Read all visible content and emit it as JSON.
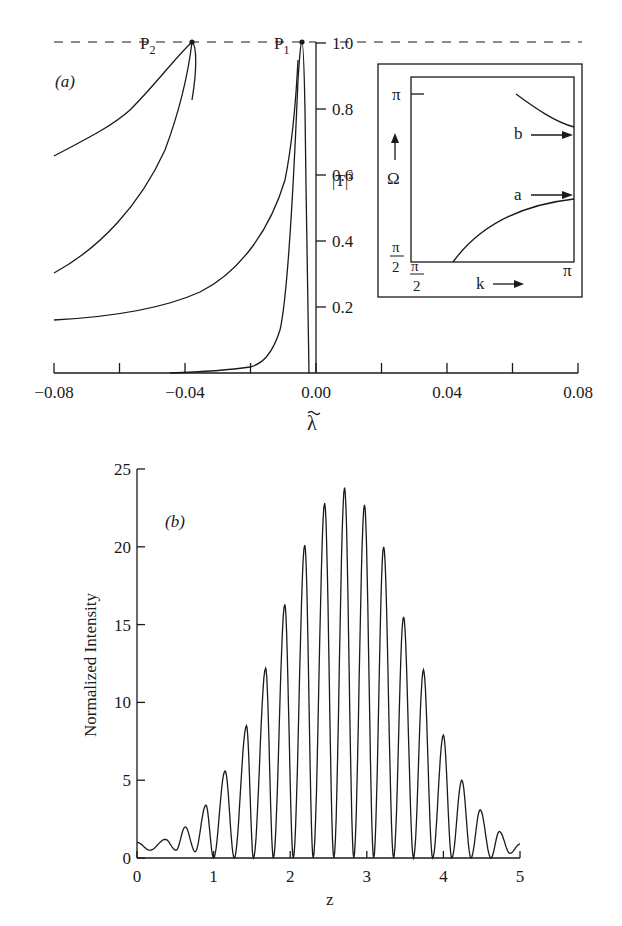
{
  "chart_data": [
    {
      "id": "a",
      "panel_label": "(a)",
      "type": "line",
      "xlabel": "λ̃",
      "ylabel": "|T|²",
      "xlim": [
        -0.08,
        0.08
      ],
      "ylim": [
        0,
        1.0
      ],
      "x_ticks": [
        "-0.08",
        "-0.04",
        "0.00",
        "0.04",
        "0.08"
      ],
      "x_minor_ticks": [
        -0.06,
        -0.02,
        0.02,
        0.06
      ],
      "y_ticks": [
        "0.2",
        "0.4",
        "0.6",
        "0.8",
        "1.0"
      ],
      "reference_line": {
        "y": 1.0,
        "style": "dashed"
      },
      "annotations": [
        {
          "text": "P₁",
          "x": -0.004,
          "y": 1.0
        },
        {
          "text": "P₂",
          "x": -0.038,
          "y": 1.0
        }
      ],
      "series": [
        {
          "name": "curve-1 (P1 peak)",
          "x": [
            -0.052,
            -0.04,
            -0.03,
            -0.02,
            -0.012,
            -0.008,
            -0.006,
            -0.0045,
            -0.004,
            -0.0035,
            -0.003,
            -0.0025,
            -0.0022
          ],
          "y": [
            0.0,
            0.01,
            0.02,
            0.05,
            0.15,
            0.35,
            0.6,
            0.9,
            1.0,
            0.9,
            0.6,
            0.3,
            0.0
          ]
        },
        {
          "name": "curve-2",
          "x": [
            -0.08,
            -0.06,
            -0.04,
            -0.03,
            -0.02,
            -0.012,
            -0.008
          ],
          "y": [
            0.17,
            0.19,
            0.25,
            0.3,
            0.41,
            0.6,
            0.95
          ]
        },
        {
          "name": "curve-3 (P2 loop lower)",
          "x": [
            -0.08,
            -0.065,
            -0.05,
            -0.042,
            -0.038
          ],
          "y": [
            0.3,
            0.42,
            0.64,
            0.86,
            1.0
          ]
        },
        {
          "name": "curve-4 (P2 loop upper)",
          "x": [
            -0.08,
            -0.065,
            -0.052,
            -0.044,
            -0.038
          ],
          "y": [
            0.66,
            0.74,
            0.85,
            0.94,
            1.0
          ]
        }
      ],
      "inset": {
        "xlabel": "k",
        "ylabel": "Ω",
        "x_tick_labels": [
          "π/2",
          "π"
        ],
        "y_tick_labels": [
          "π/2",
          "π"
        ],
        "branch_labels": [
          "a",
          "b"
        ],
        "series": [
          {
            "name": "a",
            "k": [
              1.83,
              2.2,
              2.6,
              3.0,
              3.14
            ],
            "omega": [
              1.57,
              1.95,
              2.25,
              2.42,
              2.46
            ]
          },
          {
            "name": "b",
            "k": [
              2.6,
              2.8,
              3.0,
              3.14
            ],
            "omega": [
              3.14,
              3.0,
              2.88,
              2.83
            ]
          }
        ]
      }
    },
    {
      "id": "b",
      "panel_label": "(b)",
      "type": "line",
      "xlabel": "z",
      "ylabel": "Normalized Intensity",
      "xlim": [
        0,
        5
      ],
      "ylim": [
        0,
        25
      ],
      "x_ticks": [
        "0",
        "1",
        "2",
        "3",
        "4",
        "5"
      ],
      "y_ticks": [
        "0",
        "5",
        "10",
        "15",
        "20",
        "25"
      ],
      "peaks": {
        "z": [
          0.37,
          0.63,
          0.9,
          1.15,
          1.43,
          1.68,
          1.93,
          2.19,
          2.45,
          2.71,
          2.97,
          3.22,
          3.48,
          3.74,
          4.0,
          4.24,
          4.48,
          4.73
        ],
        "intensity": [
          1.2,
          2.0,
          3.4,
          5.6,
          8.5,
          12.2,
          16.3,
          20.1,
          22.8,
          23.8,
          22.7,
          20.0,
          15.5,
          12.1,
          7.9,
          5.0,
          3.1,
          1.7
        ]
      },
      "minima": {
        "z": [
          0.17,
          0.51,
          0.76,
          1.0,
          1.27,
          1.52,
          1.78,
          2.04,
          2.3,
          2.57,
          2.83,
          3.09,
          3.35,
          3.61,
          3.86,
          4.11,
          4.36,
          4.62,
          4.87
        ],
        "intensity": [
          0.5,
          0.5,
          0.4,
          0.0,
          0.0,
          0.0,
          0.0,
          0.0,
          0.0,
          0.0,
          0.0,
          0.0,
          0.0,
          0.0,
          0.0,
          0.0,
          0.0,
          0.0,
          0.3
        ]
      },
      "start": {
        "z": 0,
        "intensity": 1.0
      },
      "end": {
        "z": 5,
        "intensity": 0.9
      }
    }
  ]
}
